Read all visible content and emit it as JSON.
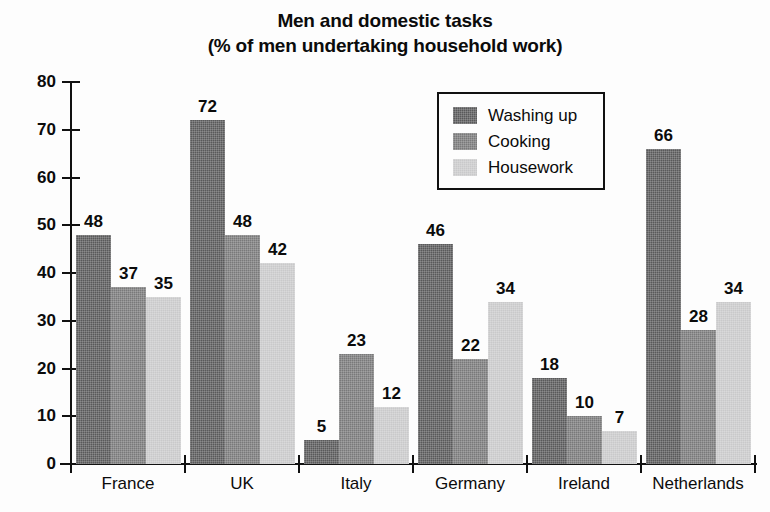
{
  "chart_data": {
    "type": "bar",
    "title": "Men and domestic tasks (% of men undertaking household work)",
    "title_lines": [
      "Men and domestic tasks",
      "(% of men undertaking household work)"
    ],
    "xlabel": "",
    "ylabel": "",
    "ylim": [
      0,
      80
    ],
    "yticks": [
      0,
      10,
      20,
      30,
      40,
      50,
      60,
      70,
      80
    ],
    "grid": false,
    "legend_position": "upper right",
    "categories": [
      "France",
      "UK",
      "Italy",
      "Germany",
      "Ireland",
      "Netherlands"
    ],
    "series": [
      {
        "name": "Washing up",
        "color": "#59595a",
        "values": [
          48,
          72,
          5,
          46,
          18,
          66
        ]
      },
      {
        "name": "Cooking",
        "color": "#79797a",
        "values": [
          37,
          48,
          23,
          22,
          10,
          28
        ]
      },
      {
        "name": "Housework",
        "color": "#c9c9ca",
        "values": [
          35,
          42,
          12,
          34,
          7,
          34
        ]
      }
    ],
    "data_labels_shown": true
  },
  "legend": {
    "items": [
      {
        "label": "Washing up",
        "swatch": "washing-up-swatch"
      },
      {
        "label": "Cooking",
        "swatch": "cooking-swatch"
      },
      {
        "label": "Housework",
        "swatch": "housework-swatch"
      }
    ]
  },
  "axis": {
    "y_tick_labels": [
      "80",
      "70",
      "60",
      "50",
      "40",
      "30",
      "20",
      "10",
      "0"
    ]
  }
}
